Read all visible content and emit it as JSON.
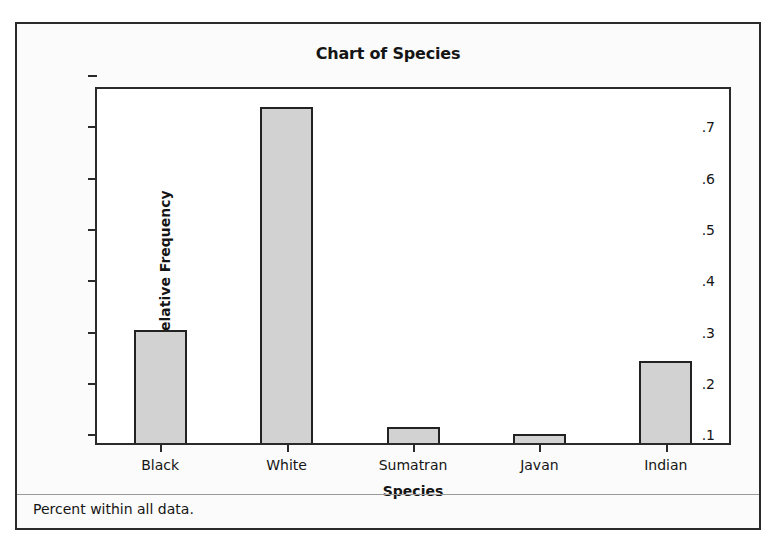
{
  "figure": {
    "title": "Chart of Species",
    "footnote": "Percent within all data."
  },
  "chart_data": {
    "type": "bar",
    "title": "Chart of Species",
    "xlabel": "Species",
    "ylabel": "Relative Frequency",
    "categories": [
      "Black",
      "White",
      "Sumatran",
      "Javan",
      "Indian"
    ],
    "values": [
      0.305,
      0.739,
      0.117,
      0.102,
      0.245
    ],
    "ylim": [
      0.085,
      0.775
    ],
    "yticks": [
      0.1,
      0.2,
      0.3,
      0.4,
      0.5,
      0.6,
      0.7
    ],
    "ytick_labels": [
      ".1",
      ".2",
      ".3",
      ".4",
      ".5",
      ".6",
      ".7"
    ],
    "grid": false,
    "legend": null,
    "bar_fill_color": "#d2d2d2",
    "bar_edge_color": "#222222",
    "axis_color": "#2a2a2a",
    "annotation": "Percent within all data."
  }
}
